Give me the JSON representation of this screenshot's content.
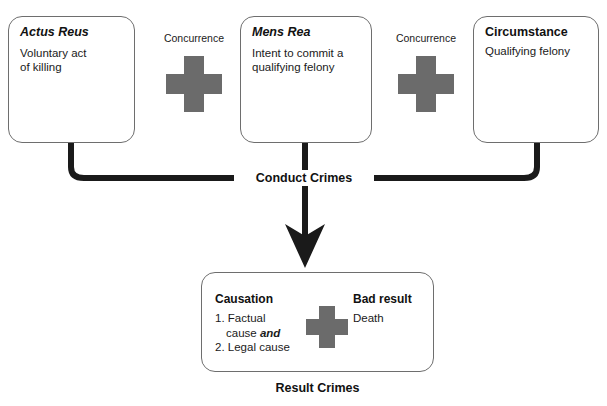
{
  "title": "ELEMENTS OF FELONY MURDER",
  "colors": {
    "plus_gray": "#6b6b6b",
    "line_black": "#1a1a1a",
    "box_border": "#6e6e6e",
    "background": "#ffffff"
  },
  "top_boxes": [
    {
      "id": "actus-reus",
      "heading": "Actus Reus",
      "body": "Voluntary act\nof killing"
    },
    {
      "id": "mens-rea",
      "heading": "Mens Rea",
      "body": "Intent to commit a\nqualifying felony"
    },
    {
      "id": "circumstance",
      "heading": "Circumstance",
      "body": "Qualifying felony"
    }
  ],
  "connectors": [
    {
      "id": "concurrence-1",
      "label": "Concurrence",
      "icon": "plus-icon"
    },
    {
      "id": "concurrence-2",
      "label": "Concurrence",
      "icon": "plus-icon"
    }
  ],
  "conduct_label": "Conduct Crimes",
  "result_box": {
    "causation": {
      "heading": "Causation",
      "items": [
        "1. Factual",
        "cause and",
        "2. Legal cause"
      ],
      "item_1_num": "1.",
      "item_1_text": "Factual",
      "item_1_cont": "cause",
      "item_1_emph": "and",
      "item_2_num": "2.",
      "item_2_text": "Legal cause"
    },
    "plus_icon": "plus-icon",
    "bad_result": {
      "heading": "Bad result",
      "body": "Death"
    }
  },
  "result_caption": "Result Crimes"
}
